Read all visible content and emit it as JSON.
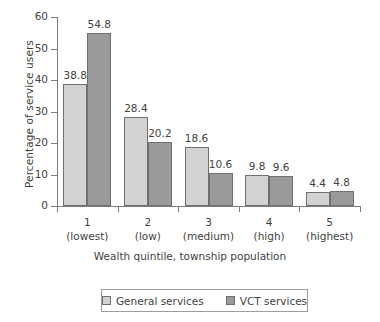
{
  "chart_data": {
    "type": "bar",
    "title": "",
    "xlabel": "Wealth quintile, township population",
    "ylabel": "Percentage of service users",
    "categories": [
      "1",
      "2",
      "3",
      "4",
      "5"
    ],
    "category_sublabels": [
      "(lowest)",
      "(low)",
      "(medium)",
      "(high)",
      "(highest)"
    ],
    "series": [
      {
        "name": "General services",
        "color": "#d2d2d2",
        "values": [
          38.8,
          28.4,
          18.6,
          9.8,
          4.4
        ],
        "value_labels": [
          "38.8",
          "28.4",
          "18.6",
          "9.8",
          "4.4"
        ]
      },
      {
        "name": "VCT services",
        "color": "#9a9a9a",
        "values": [
          54.8,
          20.2,
          10.6,
          9.6,
          4.8
        ],
        "value_labels": [
          "54.8",
          "20.2",
          "10.6",
          "9.6",
          "4.8"
        ]
      }
    ],
    "ylim": [
      0,
      60
    ],
    "yticks": [
      0,
      10,
      20,
      30,
      40,
      50,
      60
    ],
    "ytick_labels": [
      "0",
      "10",
      "20",
      "30",
      "40",
      "50",
      "60"
    ],
    "grid": false,
    "legend_position": "bottom",
    "legend_entries": [
      "General services",
      "VCT services"
    ]
  }
}
